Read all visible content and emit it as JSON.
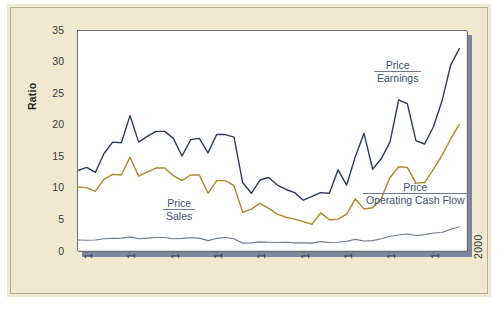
{
  "figure": {
    "panel_background": "#efe9cf",
    "plot_background": "#ffffff",
    "shadow_color": "#7b869f",
    "border_color": "#b8ae96"
  },
  "annotations": {
    "price_earnings": {
      "numerator": "Price",
      "denominator": "Earnings"
    },
    "price_sales": {
      "numerator": "Price",
      "denominator": "Sales"
    },
    "price_ocf": {
      "numerator": "Price",
      "denominator": "Operating Cash Flow"
    }
  },
  "chart_data": {
    "type": "line",
    "title": "",
    "xlabel": "",
    "ylabel": "Ratio",
    "xlim": [
      1955,
      2000
    ],
    "ylim": [
      0,
      35
    ],
    "ytick_labels": [
      "0",
      "5",
      "10",
      "15",
      "20",
      "25",
      "30",
      "35"
    ],
    "yticks": [
      0,
      5,
      10,
      15,
      20,
      25,
      30,
      35
    ],
    "xtick_labels": [
      "1955",
      "1960",
      "1965",
      "1970",
      "1975",
      "1980",
      "1985",
      "1990",
      "1995",
      "2000"
    ],
    "xticks": [
      1955,
      1960,
      1965,
      1970,
      1975,
      1980,
      1985,
      1990,
      1995,
      2000
    ],
    "grid": false,
    "legend": "inline-annotations",
    "x": [
      1955,
      1956,
      1957,
      1958,
      1959,
      1960,
      1961,
      1962,
      1963,
      1964,
      1965,
      1966,
      1967,
      1968,
      1969,
      1970,
      1971,
      1972,
      1973,
      1974,
      1975,
      1976,
      1977,
      1978,
      1979,
      1980,
      1981,
      1982,
      1983,
      1984,
      1985,
      1986,
      1987,
      1988,
      1989,
      1990,
      1991,
      1992,
      1993,
      1994,
      1995,
      1996,
      1997,
      1998,
      1999
    ],
    "series": [
      {
        "name": "Price / Earnings",
        "color": "#2d3a55",
        "values": [
          12.9,
          13.4,
          12.6,
          15.6,
          17.4,
          17.3,
          21.6,
          17.4,
          18.3,
          19.1,
          19.1,
          18.0,
          15.2,
          17.8,
          18.0,
          15.7,
          18.6,
          18.6,
          18.2,
          11.0,
          9.3,
          11.4,
          11.8,
          10.6,
          9.9,
          9.4,
          8.2,
          8.8,
          9.4,
          9.3,
          13.0,
          10.6,
          15.1,
          18.8,
          13.1,
          14.8,
          17.4,
          24.1,
          23.5,
          17.6,
          17.1,
          19.8,
          23.9,
          29.6,
          32.2
        ]
      },
      {
        "name": "Price / Operating Cash Flow",
        "color": "#a68a2d",
        "values": [
          10.3,
          10.2,
          9.6,
          11.5,
          12.3,
          12.2,
          15.0,
          12.0,
          12.7,
          13.3,
          13.3,
          12.1,
          11.3,
          12.2,
          12.2,
          9.3,
          11.3,
          11.3,
          10.5,
          6.3,
          6.8,
          7.7,
          6.9,
          6.0,
          5.5,
          5.2,
          4.8,
          4.4,
          6.2,
          5.1,
          5.2,
          6.0,
          8.4,
          6.8,
          7.0,
          8.5,
          11.8,
          13.5,
          13.4,
          10.9,
          11.0,
          13.1,
          15.3,
          17.9,
          20.2
        ]
      },
      {
        "name": "Price / Sales",
        "color": "#6d798f",
        "values": [
          1.9,
          1.85,
          1.9,
          2.1,
          2.15,
          2.2,
          2.4,
          2.1,
          2.2,
          2.3,
          2.3,
          2.1,
          2.15,
          2.25,
          2.2,
          1.8,
          2.15,
          2.3,
          2.1,
          1.4,
          1.45,
          1.6,
          1.55,
          1.5,
          1.55,
          1.45,
          1.45,
          1.4,
          1.65,
          1.5,
          1.55,
          1.7,
          2.0,
          1.75,
          1.8,
          2.1,
          2.5,
          2.7,
          2.85,
          2.6,
          2.75,
          3.0,
          3.1,
          3.6,
          4.0
        ]
      }
    ]
  }
}
